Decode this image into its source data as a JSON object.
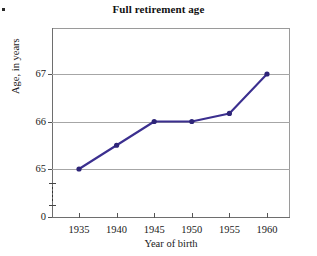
{
  "page": {
    "corner_mark": "."
  },
  "chart_data": {
    "type": "line",
    "title": "Full retirement age",
    "xlabel": "Year of birth",
    "ylabel": "Age, in years",
    "x": [
      1935,
      1940,
      1945,
      1950,
      1955,
      1960
    ],
    "categories": [
      "1935",
      "1940",
      "1945",
      "1950",
      "1955",
      "1960"
    ],
    "values": [
      65,
      65.5,
      66,
      66,
      66.17,
      67
    ],
    "series": [
      {
        "name": "Full retirement age",
        "values": [
          65,
          65.5,
          66,
          66,
          66.17,
          67
        ],
        "color": "#3b2f8f",
        "marker": "circle"
      }
    ],
    "xlim": [
      1932.5,
      1962.5
    ],
    "ylim": [
      64.6,
      67.5
    ],
    "y_ticks": [
      "0",
      "65",
      "66",
      "67"
    ],
    "y_tick_values": [
      0,
      65,
      66,
      67
    ],
    "x_ticks": [
      "1935",
      "1940",
      "1945",
      "1950",
      "1955",
      "1960"
    ],
    "grid": "horizontal",
    "legend": "none",
    "axis_break": "y-axis broken between 0 and 65",
    "colors": {
      "line": "#3b2f8f",
      "marker": "#2e2578",
      "grid": "#a6a6a6",
      "axis": "#6e6e6e",
      "text": "#1a1a1a"
    }
  }
}
